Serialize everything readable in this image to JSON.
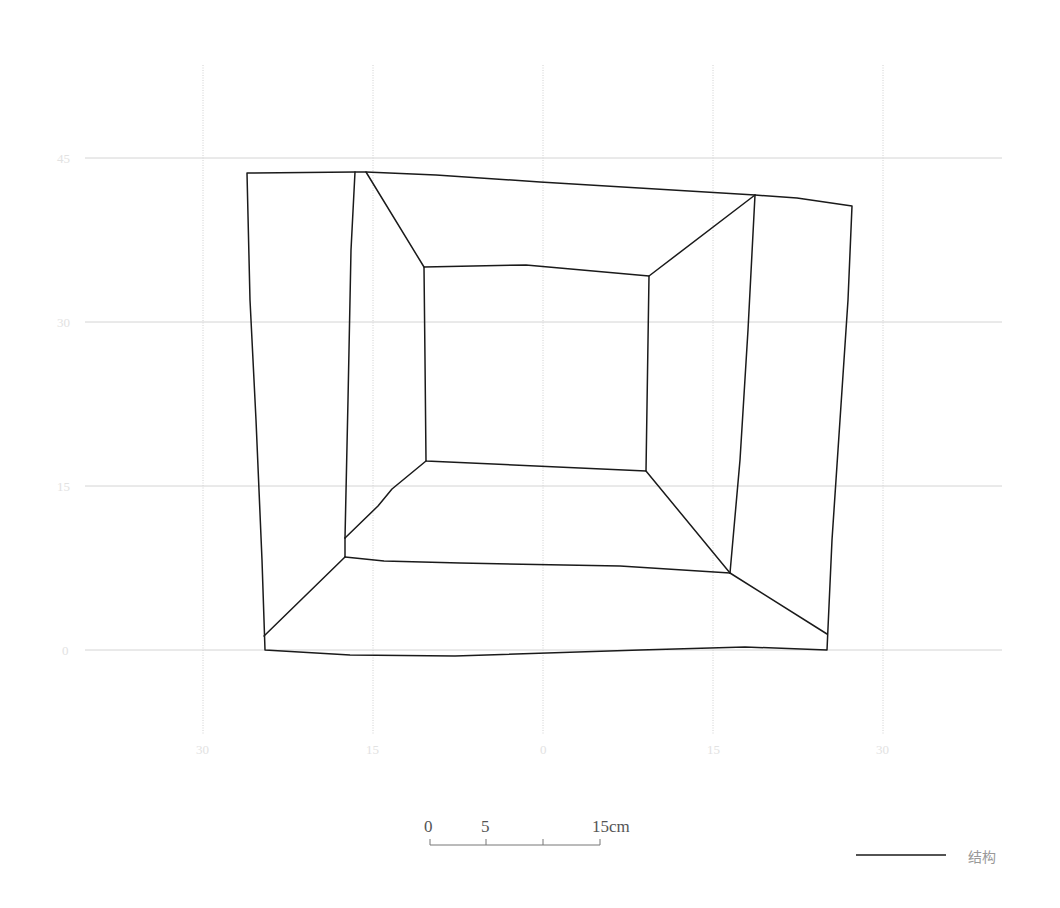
{
  "diagram": {
    "type": "plan-view structural drawing",
    "grid": {
      "x_ticks": [
        {
          "label": "30",
          "x": 203
        },
        {
          "label": "15",
          "x": 373
        },
        {
          "label": "0",
          "x": 543
        },
        {
          "label": "15",
          "x": 713
        },
        {
          "label": "30",
          "x": 883
        }
      ],
      "y_ticks": [
        {
          "label": "45",
          "y": 158
        },
        {
          "label": "30",
          "y": 322
        },
        {
          "label": "15",
          "y": 486
        },
        {
          "label": "0",
          "y": 650
        }
      ]
    },
    "structure_color": "#1a1a1a",
    "grid_color": "#d4d4d4"
  },
  "scale_bar": {
    "labels": [
      "0",
      "5",
      "15cm"
    ],
    "unit": "cm"
  },
  "legend": {
    "items": [
      {
        "label": "结构",
        "line_color": "#1a1a1a"
      }
    ]
  }
}
